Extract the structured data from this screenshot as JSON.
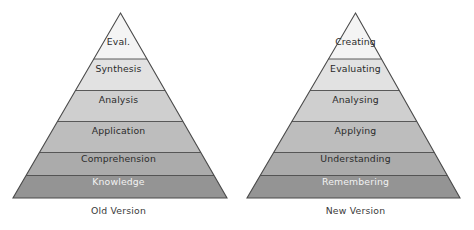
{
  "figures": [
    {
      "id": "old-version-pyramid",
      "caption": "Old Version",
      "apex": {
        "x": 120.5,
        "y": 13
      },
      "base": {
        "left": 13,
        "right": 227,
        "y": 198
      },
      "dividers": [
        59,
        90.5,
        121.5,
        152.5,
        175.5
      ],
      "bands": [
        {
          "name": "eval",
          "label": "Eval.",
          "fill": "#f4f4f4",
          "text_color": "#2b2b2b",
          "text_y": 42
        },
        {
          "name": "synthesis",
          "label": "Synthesis",
          "fill": "#e2e2e2",
          "text_color": "#2b2b2b",
          "text_y": 69
        },
        {
          "name": "analysis",
          "label": "Analysis",
          "fill": "#cfcfcf",
          "text_color": "#2b2b2b",
          "text_y": 100
        },
        {
          "name": "application",
          "label": "Application",
          "fill": "#bdbdbd",
          "text_color": "#2b2b2b",
          "text_y": 131
        },
        {
          "name": "comprehension",
          "label": "Comprehension",
          "fill": "#ababab",
          "text_color": "#2b2b2b",
          "text_y": 159
        },
        {
          "name": "knowledge",
          "label": "Knowledge",
          "fill": "#949494",
          "text_color": "#f2f2f2",
          "text_y": 182
        }
      ]
    },
    {
      "id": "new-version-pyramid",
      "caption": "New Version",
      "apex": {
        "x": 118.5,
        "y": 13
      },
      "base": {
        "left": 10,
        "right": 223,
        "y": 198
      },
      "dividers": [
        59,
        90.5,
        121.5,
        152.5,
        175.5
      ],
      "bands": [
        {
          "name": "creating",
          "label": "Creating",
          "fill": "#f4f4f4",
          "text_color": "#2b2b2b",
          "text_y": 42
        },
        {
          "name": "evaluating",
          "label": "Evaluating",
          "fill": "#e2e2e2",
          "text_color": "#2b2b2b",
          "text_y": 69
        },
        {
          "name": "analysing",
          "label": "Analysing",
          "fill": "#cfcfcf",
          "text_color": "#2b2b2b",
          "text_y": 100
        },
        {
          "name": "applying",
          "label": "Applying",
          "fill": "#bdbdbd",
          "text_color": "#2b2b2b",
          "text_y": 131
        },
        {
          "name": "understanding",
          "label": "Understanding",
          "fill": "#ababab",
          "text_color": "#2b2b2b",
          "text_y": 159
        },
        {
          "name": "remembering",
          "label": "Remembering",
          "fill": "#949494",
          "text_color": "#f2f2f2",
          "text_y": 182
        }
      ]
    }
  ],
  "style": {
    "outline_color": "#4a4a4a",
    "divider_color": "#4a4a4a",
    "background": "#ffffff"
  }
}
